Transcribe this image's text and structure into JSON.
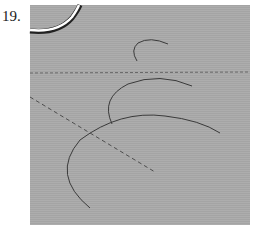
{
  "figure": {
    "number_label": "19.",
    "panel_color": "#a9a9a9",
    "stroke_color": "#3a3a3a",
    "highlight_color": "#ffffff",
    "elements": [
      {
        "name": "top-left-highlighted-arc",
        "style": "thick-white-with-dark-edge"
      },
      {
        "name": "small-arc",
        "style": "thin-solid"
      },
      {
        "name": "medium-arc",
        "style": "thin-solid"
      },
      {
        "name": "large-arc",
        "style": "thin-solid"
      },
      {
        "name": "horizontal-dashed-line",
        "style": "dashed"
      },
      {
        "name": "diagonal-dashed-line",
        "style": "dashed"
      }
    ]
  }
}
